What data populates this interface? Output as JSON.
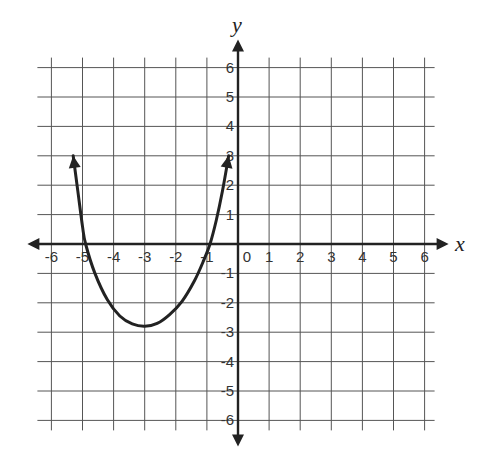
{
  "chart_data": {
    "type": "line",
    "title": "",
    "xlabel": "x",
    "ylabel": "y",
    "xlim": [
      -6,
      6
    ],
    "ylim": [
      -6,
      6
    ],
    "grid": true,
    "x_ticks": [
      "-6",
      "-5",
      "-4",
      "-3",
      "-2",
      "-1",
      "0",
      "1",
      "2",
      "3",
      "4",
      "5",
      "6"
    ],
    "y_ticks": [
      "6",
      "5",
      "4",
      "3",
      "2",
      "1",
      "-1",
      "-2",
      "-3",
      "-4",
      "-5",
      "-6"
    ],
    "series": [
      {
        "name": "parabola",
        "description": "Upward-opening parabola with vertex near (-3, -2.8), x-intercepts near -5 and -1, arrowheads at both ends near y = 3",
        "x": [
          -5.3,
          -5.15,
          -5.0,
          -4.9,
          -4.6,
          -4.2,
          -3.8,
          -3.4,
          -3.0,
          -2.6,
          -2.2,
          -1.8,
          -1.4,
          -1.1,
          -0.9,
          -0.7,
          -0.5,
          -0.3
        ],
        "y": [
          3.0,
          1.8,
          0.6,
          0.0,
          -1.0,
          -1.9,
          -2.45,
          -2.72,
          -2.8,
          -2.7,
          -2.4,
          -1.95,
          -1.25,
          -0.55,
          0.0,
          0.8,
          1.8,
          3.0
        ]
      }
    ]
  }
}
